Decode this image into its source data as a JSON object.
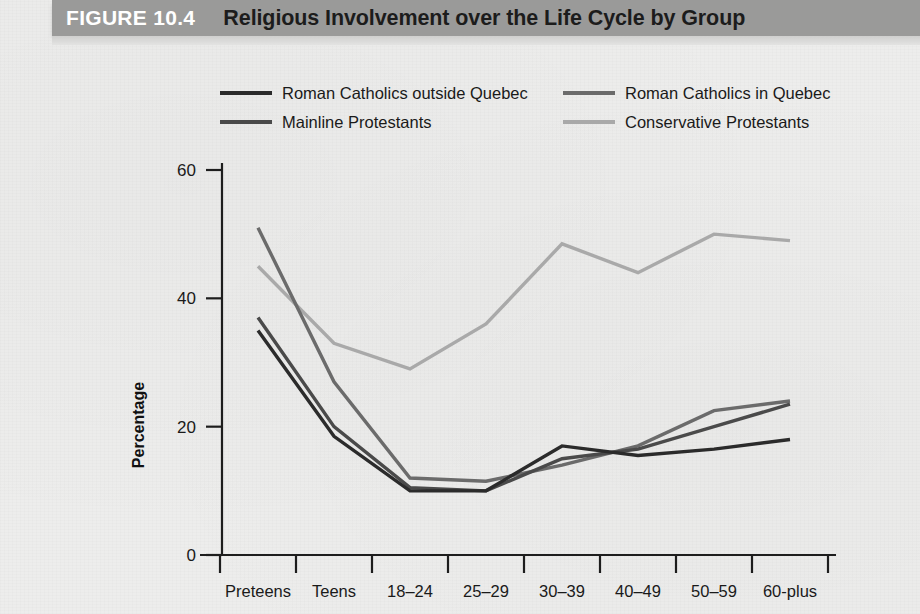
{
  "header": {
    "figure_number": "FIGURE 10.4",
    "title": "Religious Involvement over the Life Cycle by Group",
    "band_color": "#9a9a99"
  },
  "chart_data": {
    "type": "line",
    "title": "Religious Involvement over the Life Cycle by Group",
    "xlabel": "",
    "ylabel": "Percentage",
    "ylim": [
      0,
      60
    ],
    "yticks": [
      0,
      20,
      40,
      60
    ],
    "ytick_labels": [
      "0",
      "20",
      "40",
      "60"
    ],
    "grid": false,
    "legend_position": "top",
    "categories": [
      "Preteens",
      "Teens",
      "18–24",
      "25–29",
      "30–39",
      "40–49",
      "50–59",
      "60-plus"
    ],
    "series": [
      {
        "name": "Roman Catholics outside Quebec",
        "color": "#2b2b2b",
        "values": [
          35,
          18.5,
          10,
          10,
          17,
          15.5,
          16.5,
          18
        ]
      },
      {
        "name": "Roman Catholics in Quebec",
        "color": "#6b6b6b",
        "values": [
          51,
          27,
          12,
          11.5,
          14,
          17,
          22.5,
          24
        ]
      },
      {
        "name": "Mainline Protestants",
        "color": "#4a4a4a",
        "values": [
          37,
          20,
          10.5,
          10,
          15,
          16.5,
          20,
          23.5
        ]
      },
      {
        "name": "Conservative Protestants",
        "color": "#a9a9a9",
        "values": [
          45,
          33,
          29,
          36,
          48.5,
          44,
          50,
          49
        ]
      }
    ]
  }
}
